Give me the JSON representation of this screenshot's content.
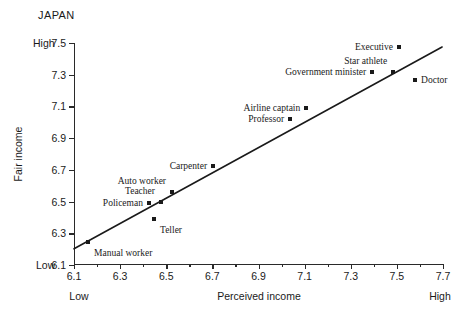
{
  "chart_data": {
    "type": "scatter",
    "title": "JAPAN",
    "xlabel": "Perceived income",
    "ylabel": "Fair income",
    "xlim": [
      6.1,
      7.7
    ],
    "ylim": [
      6.1,
      7.5
    ],
    "xticks": [
      "6.1",
      "6.3",
      "6.5",
      "6.7",
      "6.9",
      "7.1",
      "7.3",
      "7.5",
      "7.7"
    ],
    "xtick_values": [
      6.1,
      6.3,
      6.5,
      6.7,
      6.9,
      7.1,
      7.3,
      7.5,
      7.7
    ],
    "x_minor_values": [
      6.2,
      6.4,
      6.6,
      6.8,
      7.0,
      7.2,
      7.4,
      7.6
    ],
    "yticks": [
      "6.1",
      "6.3",
      "6.5",
      "6.7",
      "6.9",
      "7.1",
      "7.3",
      "7.5"
    ],
    "ytick_values": [
      6.1,
      6.3,
      6.5,
      6.7,
      6.9,
      7.1,
      7.3,
      7.5
    ],
    "x_low_label": "Low",
    "x_high_label": "High",
    "y_low_label": "Low",
    "y_high_label": "High",
    "grid": false,
    "legend": "none",
    "marker_color": "#1a1a1a",
    "line_color": "#1a1a1a",
    "points": [
      {
        "label": "Manual worker",
        "x": 6.161,
        "y": 6.247,
        "label_pos": "below-right"
      },
      {
        "label": "Policeman",
        "x": 6.425,
        "y": 6.494,
        "label_pos": "left"
      },
      {
        "label": "Teller",
        "x": 6.447,
        "y": 6.393,
        "label_pos": "below-right"
      },
      {
        "label": "Teacher",
        "x": 6.477,
        "y": 6.5,
        "label_pos": "above-left"
      },
      {
        "label": "Auto worker",
        "x": 6.525,
        "y": 6.563,
        "label_pos": "above-left"
      },
      {
        "label": "Carpenter",
        "x": 6.703,
        "y": 6.727,
        "label_pos": "left"
      },
      {
        "label": "Professor",
        "x": 7.037,
        "y": 7.021,
        "label_pos": "left"
      },
      {
        "label": "Airline captain",
        "x": 7.107,
        "y": 7.09,
        "label_pos": "left"
      },
      {
        "label": "Government minister",
        "x": 7.393,
        "y": 7.317,
        "label_pos": "left"
      },
      {
        "label": "Star athlete",
        "x": 7.484,
        "y": 7.317,
        "label_pos": "above-left"
      },
      {
        "label": "Executive",
        "x": 7.509,
        "y": 7.475,
        "label_pos": "left"
      },
      {
        "label": "Doctor",
        "x": 7.579,
        "y": 7.267,
        "label_pos": "right"
      }
    ],
    "trend_line": {
      "x_start": 6.1,
      "y_start": 6.202,
      "x_end": 7.696,
      "y_end": 7.475
    }
  }
}
